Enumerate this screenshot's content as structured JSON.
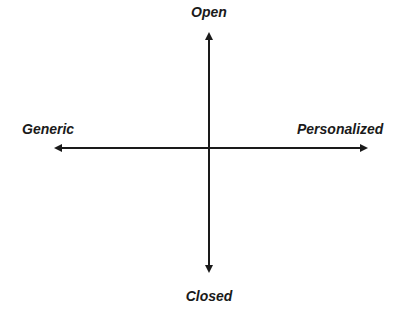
{
  "diagram": {
    "type": "quadrant-axes",
    "axes": {
      "vertical": {
        "top_label": "Open",
        "bottom_label": "Closed"
      },
      "horizontal": {
        "left_label": "Generic",
        "right_label": "Personalized"
      }
    },
    "colors": {
      "background": "#ffffff",
      "axis": "#1a1a1a",
      "text": "#1a1a1a"
    }
  }
}
